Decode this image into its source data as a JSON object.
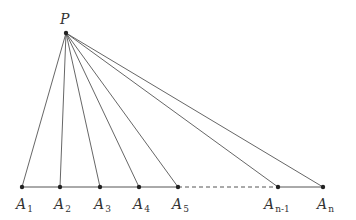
{
  "diagram": {
    "apex": {
      "id": "P",
      "label": "P"
    },
    "base_points": [
      {
        "id": "A1",
        "base": "A",
        "sub": "1"
      },
      {
        "id": "A2",
        "base": "A",
        "sub": "2"
      },
      {
        "id": "A3",
        "base": "A",
        "sub": "3"
      },
      {
        "id": "A4",
        "base": "A",
        "sub": "4"
      },
      {
        "id": "A5",
        "base": "A",
        "sub": "5"
      },
      {
        "id": "An-1",
        "base": "A",
        "sub": "n-1"
      },
      {
        "id": "An",
        "base": "A",
        "sub": "n"
      }
    ],
    "base_segments": [
      {
        "from": "A1",
        "to": "A5",
        "style": "solid"
      },
      {
        "from": "A5",
        "to": "An-1",
        "style": "dashed"
      },
      {
        "from": "An-1",
        "to": "An",
        "style": "solid"
      }
    ],
    "colors": {
      "line": "#555555",
      "point": "#222222",
      "text": "#333333"
    }
  }
}
